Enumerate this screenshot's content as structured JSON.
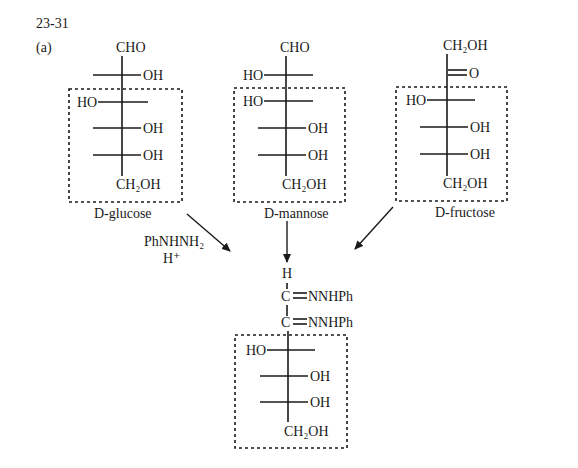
{
  "problem": {
    "number": "23-31",
    "part": "(a)"
  },
  "molecules": {
    "glucose": {
      "name": "D-glucose",
      "top": "CHO",
      "c2_right": "OH",
      "c3_left": "HO",
      "c4_right": "OH",
      "c5_right": "OH",
      "bottom": "CH₂OH"
    },
    "mannose": {
      "name": "D-mannose",
      "top": "CHO",
      "c2_left": "HO",
      "c3_left": "HO",
      "c4_right": "OH",
      "c5_right": "OH",
      "bottom": "CH₂OH"
    },
    "fructose": {
      "name": "D-fructose",
      "top": "CH₂OH",
      "c2_right": "O",
      "c3_left": "HO",
      "c4_right": "OH",
      "c5_right": "OH",
      "bottom": "CH₂OH"
    },
    "osazone": {
      "top": "H",
      "c1_right": "NNHPh",
      "c2_right": "NNHPh",
      "c3_left": "HO",
      "c4_right": "OH",
      "c5_right": "OH",
      "bottom": "CH₂OH",
      "c_label": "C"
    }
  },
  "reagent": {
    "line1": "PhNHNH₂",
    "line2": "H⁺"
  },
  "colors": {
    "ink": "#1a1a1a",
    "background": "#ffffff"
  }
}
